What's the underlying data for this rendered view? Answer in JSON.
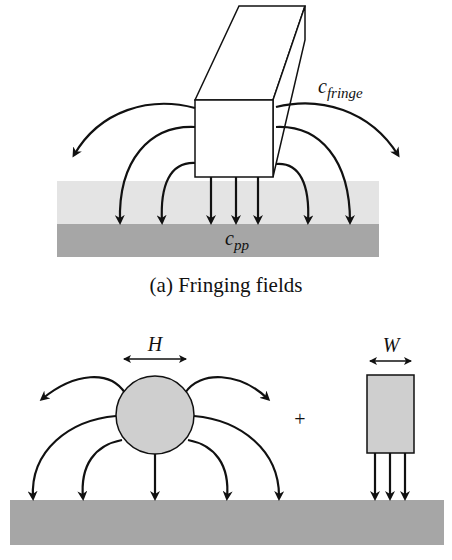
{
  "figure": {
    "panel_a": {
      "caption": "(a) Fringing fields",
      "label_fringe": {
        "base": "c",
        "sub": "fringe"
      },
      "label_pp": {
        "base": "c",
        "sub": "pp"
      },
      "colors": {
        "dielectric": "#e4e4e4",
        "ground": "#a6a6a6",
        "wire": "#ffffff"
      }
    },
    "panel_b": {
      "label_H": "H",
      "label_W": "W",
      "plus": "+",
      "colors": {
        "cylinder": "#cfcfcf",
        "plate": "#cfcfcf",
        "ground": "#a6a6a6"
      }
    }
  }
}
